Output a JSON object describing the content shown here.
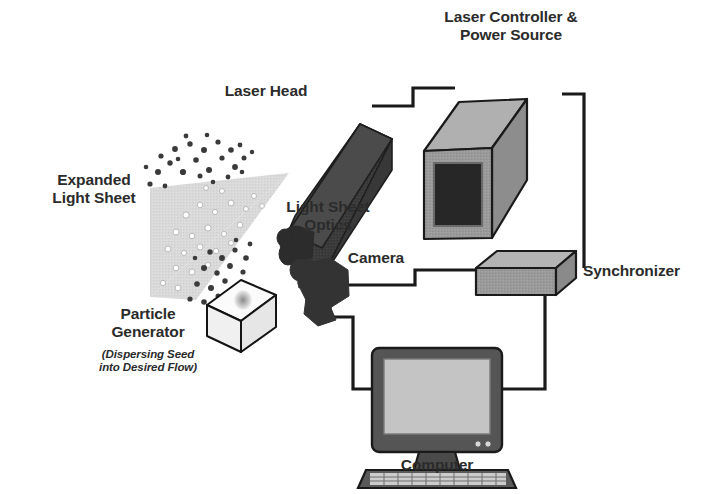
{
  "diagram": {
    "background_color": "#ffffff",
    "label_color": "#2b2b2b",
    "palette": {
      "dark_component": "#3a3a3a",
      "mid_gray_component": "#9a9a9a",
      "light_gray_component": "#c9c9c9",
      "light_sheet": "#d8d8d8",
      "wire": "#1a1a1a",
      "outline": "#141414",
      "panel_dark": "#2a2a2a",
      "white_component": "#fbfbfb"
    },
    "labels": {
      "laser_controller": "Laser Controller &\nPower Source",
      "laser_head": "Laser Head",
      "expanded_light_sheet": "Expanded\nLight Sheet",
      "light_sheet_optics": "Light Sheet\nOptics",
      "particle_generator": "Particle\nGenerator",
      "particle_generator_sub": "(Dispersing Seed\ninto Desired Flow)",
      "camera": "Camera",
      "synchronizer": "Synchronizer",
      "computer": "Computer"
    },
    "components": [
      {
        "id": "laser-controller",
        "name": "Laser Controller & Power Source",
        "shape": "gray-3d-box-with-dark-front-panel"
      },
      {
        "id": "laser-head",
        "name": "Laser Head",
        "shape": "dark-3d-rectangular-box"
      },
      {
        "id": "light-sheet-optics",
        "name": "Light Sheet Optics",
        "shape": "dark-lens-cluster"
      },
      {
        "id": "expanded-light-sheet",
        "name": "Expanded Light Sheet",
        "shape": "light-gray-triangular-fan"
      },
      {
        "id": "particle-generator",
        "name": "Particle Generator",
        "shape": "white-3d-box"
      },
      {
        "id": "camera",
        "name": "Camera",
        "shape": "dark-camera-body-blob"
      },
      {
        "id": "synchronizer",
        "name": "Synchronizer",
        "shape": "flat-gray-3d-box"
      },
      {
        "id": "computer",
        "name": "Computer",
        "shape": "flat-panel-monitor-with-keyboard"
      }
    ],
    "connections": [
      {
        "from": "laser-head",
        "to": "laser-controller"
      },
      {
        "from": "laser-controller",
        "to": "synchronizer"
      },
      {
        "from": "camera",
        "to": "synchronizer"
      },
      {
        "from": "camera",
        "to": "computer"
      },
      {
        "from": "synchronizer",
        "to": "computer"
      }
    ]
  }
}
